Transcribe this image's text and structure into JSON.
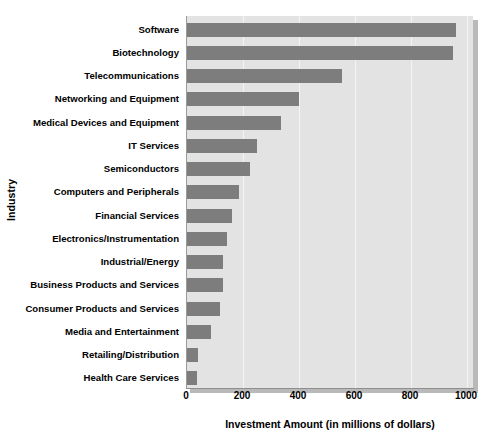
{
  "chart_data": {
    "type": "bar",
    "orientation": "horizontal",
    "title": "",
    "xlabel": "Investment Amount (in millions of dollars)",
    "ylabel": "Industry",
    "xlim": [
      0,
      1000
    ],
    "xticks": [
      0,
      200,
      400,
      600,
      800,
      1000
    ],
    "grid": true,
    "legend": null,
    "categories": [
      "Software",
      "Biotechnology",
      "Telecommunications",
      "Networking and Equipment",
      "Medical Devices and Equipment",
      "IT Services",
      "Semiconductors",
      "Computers and Peripherals",
      "Financial Services",
      "Electronics/Instrumentation",
      "Industrial/Energy",
      "Business Products and Services",
      "Consumer Products and Services",
      "Media and Entertainment",
      "Retailing/Distribution",
      "Health Care Services"
    ],
    "values": [
      960,
      950,
      555,
      400,
      335,
      250,
      225,
      185,
      160,
      143,
      130,
      128,
      118,
      85,
      38,
      35
    ],
    "colors": {
      "bar": "#7d7d7d",
      "plot_background": "#e3e3e3",
      "gridline": "#f4f4f4",
      "page_background": "#ffffff",
      "axis": "#8e8e8e",
      "shadow": "#b9b9b9"
    }
  }
}
